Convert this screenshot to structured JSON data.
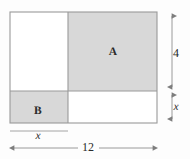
{
  "figure": {
    "colors": {
      "shaded_fill": "#d8d8d8",
      "unshaded_fill": "#ffffff",
      "stroke": "#9a9a9a",
      "text": "#2b2b2b",
      "background": "#fdfdfd"
    },
    "outer_rect": {
      "name": "outer-rectangle",
      "width_label": "12",
      "x": 10,
      "y": 12,
      "w": 147,
      "h": 111
    },
    "regions": [
      {
        "id": "top-left",
        "label": "",
        "shaded": false,
        "x": 10,
        "y": 12,
        "w": 58,
        "h": 79
      },
      {
        "id": "top-right",
        "label": "A",
        "shaded": true,
        "x": 68,
        "y": 12,
        "w": 89,
        "h": 79
      },
      {
        "id": "bottom-left",
        "label": "B",
        "shaded": true,
        "x": 10,
        "y": 91,
        "w": 58,
        "h": 32
      },
      {
        "id": "bottom-right",
        "label": "",
        "shaded": false,
        "x": 68,
        "y": 91,
        "w": 89,
        "h": 32
      }
    ],
    "labels": {
      "region_a": "A",
      "region_b": "B"
    },
    "dimensions": {
      "right_upper": {
        "name": "height-4",
        "value": "4",
        "kind": "number",
        "from_y": 12,
        "to_y": 91,
        "axis_x": 172
      },
      "right_lower": {
        "name": "height-x",
        "value": "x",
        "kind": "variable",
        "from_y": 91,
        "to_y": 123,
        "axis_x": 172
      },
      "bottom_short": {
        "name": "width-x",
        "value": "x",
        "kind": "variable",
        "from_x": 10,
        "to_x": 68,
        "axis_y": 134
      },
      "bottom_full": {
        "name": "width-12",
        "value": "12",
        "kind": "number",
        "from_x": 10,
        "to_x": 157,
        "axis_y": 148
      }
    }
  }
}
